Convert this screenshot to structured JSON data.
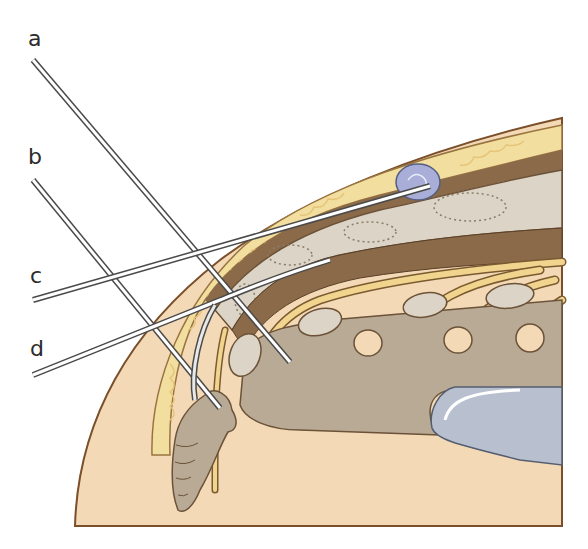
{
  "figure": {
    "labels": [
      {
        "id": "a",
        "text": "a"
      },
      {
        "id": "b",
        "text": "b"
      },
      {
        "id": "c",
        "text": "c"
      },
      {
        "id": "d",
        "text": "d"
      }
    ],
    "structures": [
      "skin",
      "subcutaneous-fat",
      "cyst-nodule",
      "sacral-bone",
      "dura",
      "nerve-roots",
      "vertebral-bodies",
      "coccyx",
      "rectum"
    ],
    "colors": {
      "skin": "#f3d9b6",
      "skin_outline": "#7a4f2a",
      "fat": "#f2dfa0",
      "fat_lines": "#e6c47a",
      "bone": "#dcd4c6",
      "bone_dots": "#8a7d6a",
      "dark_band": "#8b6a4a",
      "soft_tissue": "#b9aa96",
      "nerve": "#f1d58e",
      "nodule": "#a9aed8",
      "rectum": "#b8c0cf",
      "needle": "#ffffff",
      "needle_outline": "#4a4a4a",
      "label_text": "#2b2b2b"
    }
  }
}
